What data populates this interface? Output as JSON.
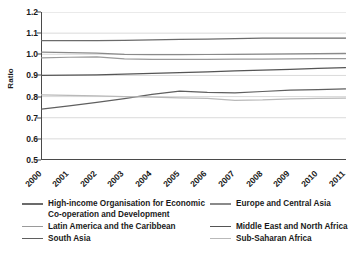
{
  "chart_data": {
    "type": "line",
    "title": "",
    "xlabel": "",
    "ylabel": "Ratio",
    "x": [
      2000,
      2001,
      2002,
      2003,
      2004,
      2005,
      2006,
      2007,
      2008,
      2009,
      2010,
      2011
    ],
    "xtick_labels": [
      "2000",
      "2001",
      "2002",
      "2003",
      "2004",
      "2005",
      "2006",
      "2007",
      "2008",
      "2009",
      "2010",
      "2011"
    ],
    "ytick_labels": [
      "1.2",
      "1.1",
      "1.0",
      "0.9",
      "0.8",
      "0.7",
      "0.6",
      "0.5"
    ],
    "ylim": [
      0.5,
      1.2
    ],
    "ytick_step": 0.1,
    "grid": "horizontal",
    "legend_position": "below",
    "series": [
      {
        "name": "High-income Organisation for Economic Co-operation and Development",
        "color": "#6b6b6b",
        "values": [
          1.065,
          1.065,
          1.065,
          1.066,
          1.068,
          1.07,
          1.072,
          1.074,
          1.077,
          1.077,
          1.077,
          1.077
        ]
      },
      {
        "name": "Europe and Central Asia",
        "color": "#8a8a8a",
        "values": [
          1.01,
          1.008,
          1.005,
          1.0,
          0.998,
          0.998,
          0.999,
          1.0,
          1.001,
          1.002,
          1.003,
          1.004
        ]
      },
      {
        "name": "Latin America and the Caribbean",
        "color": "#9a9a9a",
        "values": [
          0.983,
          0.986,
          0.988,
          0.978,
          0.976,
          0.976,
          0.976,
          0.977,
          0.977,
          0.978,
          0.979,
          0.98
        ]
      },
      {
        "name": "Middle East and North Africa",
        "color": "#555555",
        "values": [
          0.9,
          0.901,
          0.903,
          0.906,
          0.91,
          0.913,
          0.917,
          0.921,
          0.925,
          0.929,
          0.933,
          0.937
        ]
      },
      {
        "name": "South Asia",
        "color": "#5f5f5f",
        "values": [
          0.741,
          0.756,
          0.772,
          0.79,
          0.81,
          0.826,
          0.82,
          0.818,
          0.824,
          0.83,
          0.833,
          0.836
        ]
      },
      {
        "name": "Sub-Saharan Africa",
        "color": "#b9b9b9",
        "values": [
          0.808,
          0.806,
          0.803,
          0.8,
          0.797,
          0.794,
          0.791,
          0.782,
          0.784,
          0.789,
          0.791,
          0.793
        ]
      }
    ]
  },
  "legend": {
    "left": [
      {
        "label": "High-income Organisation for Economic Co-operation and Development",
        "color": "#6b6b6b"
      },
      {
        "label": "Latin America and the Caribbean",
        "color": "#9a9a9a"
      },
      {
        "label": "South Asia",
        "color": "#5f5f5f"
      }
    ],
    "right": [
      {
        "label": "Europe and Central Asia",
        "color": "#8a8a8a"
      },
      {
        "label": "Middle East and North Africa",
        "color": "#555555"
      },
      {
        "label": "Sub-Saharan Africa",
        "color": "#b9b9b9"
      }
    ]
  }
}
